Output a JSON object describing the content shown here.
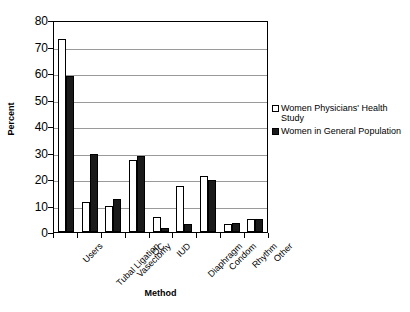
{
  "chart_data": {
    "type": "bar",
    "title": "",
    "xlabel": "Method",
    "ylabel": "Percent",
    "categories": [
      "Users",
      "Tubal Ligation",
      "Vasectomy",
      "OC",
      "IUD",
      "Diaphragm",
      "Condom",
      "Rhythm",
      "Other"
    ],
    "series": [
      {
        "name": "Women Physicians' Health Study",
        "color": "#ffffff",
        "values": [
          73,
          11.5,
          10,
          27,
          5.5,
          17.5,
          21,
          3,
          5
        ]
      },
      {
        "name": "Women in General Population",
        "color": "#1a1a1a",
        "values": [
          59,
          29.5,
          12.5,
          28.5,
          1.5,
          3,
          19.5,
          3.5,
          5
        ]
      }
    ],
    "ylim": [
      0,
      80
    ],
    "yticks": [
      0,
      10,
      20,
      30,
      40,
      50,
      60,
      70,
      80
    ],
    "ytick_labels": [
      "0",
      "10",
      "20",
      "30",
      "40",
      "50",
      "60",
      "70",
      "80"
    ],
    "grid": "horizontal",
    "legend_position": "right"
  },
  "legend": {
    "entries": [
      {
        "label": "Women Physicians' Health Study"
      },
      {
        "label": "Women in General Population"
      }
    ]
  },
  "axes": {
    "y_title": "Percent",
    "x_title": "Method"
  }
}
